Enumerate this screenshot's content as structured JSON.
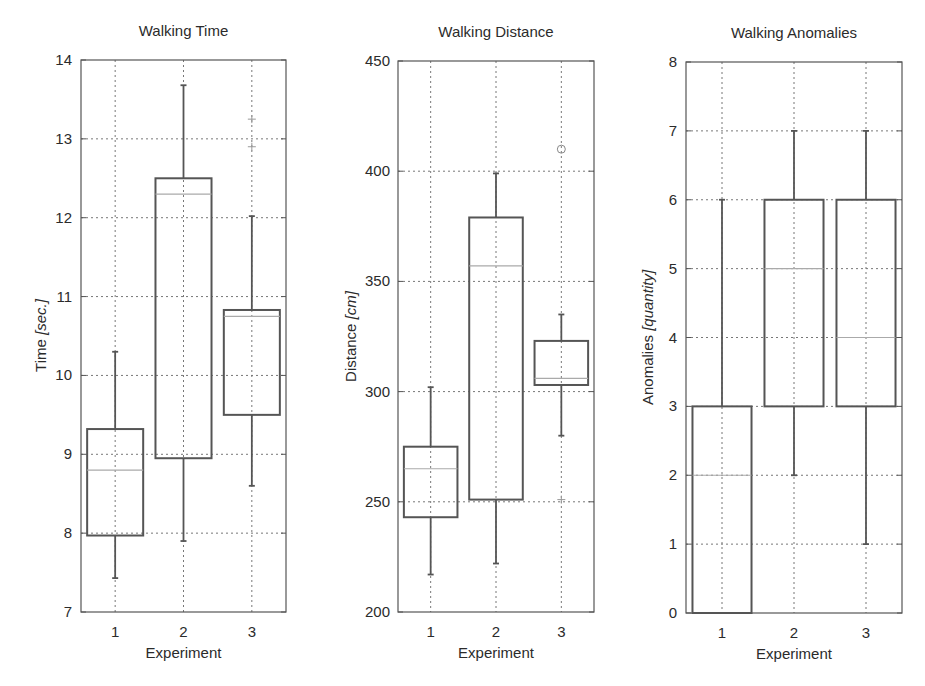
{
  "chart_data": [
    {
      "type": "boxplot",
      "title": "Walking Time",
      "xlabel": "Experiment",
      "ylabel": "Time",
      "ylabel_unit": "[sec.]",
      "categories": [
        "1",
        "2",
        "3"
      ],
      "ylim": [
        7,
        14
      ],
      "yticks": [
        7,
        8,
        9,
        10,
        11,
        12,
        13,
        14
      ],
      "grid": true,
      "boxes": [
        {
          "category": "1",
          "whisker_low": 7.43,
          "q1": 7.97,
          "median": 8.8,
          "q3": 9.32,
          "whisker_high": 10.3,
          "outliers": []
        },
        {
          "category": "2",
          "whisker_low": 7.9,
          "q1": 8.95,
          "median": 12.3,
          "q3": 12.5,
          "whisker_high": 13.68,
          "outliers": []
        },
        {
          "category": "3",
          "whisker_low": 8.6,
          "q1": 9.5,
          "median": 10.75,
          "q3": 10.83,
          "whisker_high": 12.02,
          "outliers": [
            12.9,
            13.25
          ],
          "outlier_marker": "plus"
        }
      ]
    },
    {
      "type": "boxplot",
      "title": "Walking Distance",
      "xlabel": "Experiment",
      "ylabel": "Distance",
      "ylabel_unit": "[cm]",
      "categories": [
        "1",
        "2",
        "3"
      ],
      "ylim": [
        200,
        450
      ],
      "yticks": [
        200,
        250,
        300,
        350,
        400,
        450
      ],
      "grid": true,
      "boxes": [
        {
          "category": "1",
          "whisker_low": 217,
          "q1": 243,
          "median": 265,
          "q3": 275,
          "whisker_high": 302,
          "outliers": []
        },
        {
          "category": "2",
          "whisker_low": 222,
          "q1": 251,
          "median": 357,
          "q3": 379,
          "whisker_high": 399,
          "outliers": []
        },
        {
          "category": "3",
          "whisker_low": 280,
          "q1": 303,
          "median": 306,
          "q3": 323,
          "whisker_high": 335,
          "outliers": [
            251,
            410
          ],
          "outlier_markers": [
            "plus",
            "circle"
          ]
        }
      ]
    },
    {
      "type": "boxplot",
      "title": "Walking Anomalies",
      "xlabel": "Experiment",
      "ylabel": "Anomalies",
      "ylabel_unit": "[quantity]",
      "categories": [
        "1",
        "2",
        "3"
      ],
      "ylim": [
        0,
        8
      ],
      "yticks": [
        0,
        1,
        2,
        3,
        4,
        5,
        6,
        7,
        8
      ],
      "grid": true,
      "boxes": [
        {
          "category": "1",
          "whisker_low": 0,
          "q1": 0,
          "median": 2,
          "q3": 3,
          "whisker_high": 6,
          "outliers": []
        },
        {
          "category": "2",
          "whisker_low": 2,
          "q1": 3,
          "median": 5,
          "q3": 6,
          "whisker_high": 7,
          "outliers": []
        },
        {
          "category": "3",
          "whisker_low": 1,
          "q1": 3,
          "median": 4,
          "q3": 6,
          "whisker_high": 7,
          "outliers": []
        }
      ]
    }
  ],
  "colors": {
    "axis": "#555555",
    "grid": "#777777",
    "box": "#555555",
    "median": "#aaaaaa",
    "text": "#2b2b2b"
  }
}
